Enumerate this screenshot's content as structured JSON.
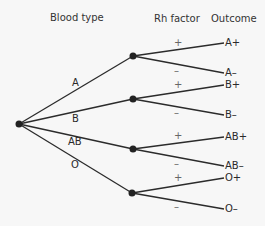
{
  "headers": {
    "blood_type": "Blood type",
    "rh_factor": "Rh factor",
    "outcome": "Outcome"
  },
  "branches": [
    {
      "label": "A"
    },
    {
      "label": "B"
    },
    {
      "label": "AB"
    },
    {
      "label": "O"
    }
  ],
  "signs": {
    "plus": "+",
    "minus": "–"
  },
  "outcomes": [
    "A+",
    "A–",
    "B+",
    "B–",
    "AB+",
    "AB–",
    "O+",
    "O–"
  ],
  "colors": {
    "line": "#2b2b2b",
    "node": "#222222",
    "background": "#f7f7f7"
  }
}
